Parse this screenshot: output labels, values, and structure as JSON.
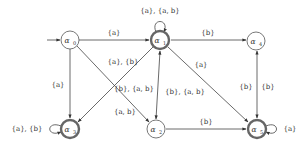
{
  "diagram": {
    "type": "automaton",
    "initial_state": "a0",
    "states": [
      {
        "id": "a0",
        "label": "α0",
        "x": 70,
        "y": 40,
        "accepting": false
      },
      {
        "id": "a1",
        "label": "α1",
        "x": 160,
        "y": 40,
        "accepting": true
      },
      {
        "id": "a4",
        "label": "α4",
        "x": 256,
        "y": 41,
        "accepting": false
      },
      {
        "id": "a3",
        "label": "α3",
        "x": 70,
        "y": 129,
        "accepting": true
      },
      {
        "id": "a2",
        "label": "α2",
        "x": 156,
        "y": 129,
        "accepting": false
      },
      {
        "id": "a5",
        "label": "α5",
        "x": 257,
        "y": 129,
        "accepting": true
      }
    ],
    "edges": [
      {
        "from": "a0",
        "to": "a1",
        "label": "{a}"
      },
      {
        "from": "a0",
        "to": "a3",
        "label": "{a}"
      },
      {
        "from": "a0",
        "to": "a2",
        "label": "{a, b}"
      },
      {
        "from": "a1",
        "to": "a3",
        "label": "{a}, {b}"
      },
      {
        "from": "a1",
        "to": "a1",
        "label": "{a}, {a, b}"
      },
      {
        "from": "a1",
        "to": "a4",
        "label": "{b}"
      },
      {
        "from": "a1",
        "to": "a5",
        "label": "{a}"
      },
      {
        "from": "a1",
        "to": "a2",
        "label": "{b}, {a, b}"
      },
      {
        "from": "a2",
        "to": "a1",
        "label": "{b}, {a, b}"
      },
      {
        "from": "a2",
        "to": "a5",
        "label": "{b}"
      },
      {
        "from": "a4",
        "to": "a5",
        "label": "{b}"
      },
      {
        "from": "a5",
        "to": "a4",
        "label": "{b}"
      },
      {
        "from": "a3",
        "to": "a3",
        "label": "{a}, {b}"
      },
      {
        "from": "a5",
        "to": "a5",
        "label": "{a}"
      }
    ]
  },
  "labels": {
    "a0": "α",
    "a0_sub": "0",
    "a1": "α",
    "a1_sub": "1",
    "a2": "α",
    "a2_sub": "2",
    "a3": "α",
    "a3_sub": "3",
    "a4": "α",
    "a4_sub": "4",
    "a5": "α",
    "a5_sub": "5",
    "e_a0_a1": "{a}",
    "e_a0_a3": "{a}",
    "e_a1_a3": "{a}, {b}",
    "e_a0_a2": "{a, b}",
    "e_a1_loop": "{a}, {a, b}",
    "e_a1_a4": "{b}",
    "e_a1_a5": "{a}",
    "e_a1_a2_left": "{b}, {a, b}",
    "e_a1_a2_right": "{b}, {a, b}",
    "e_a2_a5": "{b}",
    "e_a4_a5_left": "{b}",
    "e_a4_a5_right": "{b}",
    "e_a3_loop": "{a}, {b}",
    "e_a5_loop": "{a}"
  }
}
